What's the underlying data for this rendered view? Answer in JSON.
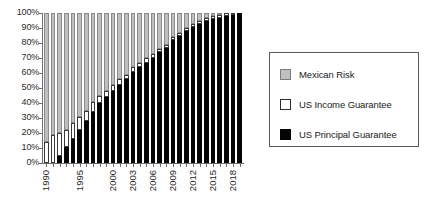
{
  "chart_data": {
    "type": "bar",
    "subtype": "stacked-100-percent",
    "title": "",
    "xlabel": "",
    "ylabel": "",
    "ylim": [
      0,
      100
    ],
    "grid": false,
    "legend_position": "right",
    "categories": [
      "1990",
      "1991",
      "1992",
      "1993",
      "1994",
      "1995",
      "1996",
      "1997",
      "1998",
      "1999",
      "2000",
      "2001",
      "2002",
      "2003",
      "2004",
      "2005",
      "2006",
      "2007",
      "2008",
      "2009",
      "2010",
      "2011",
      "2012",
      "2013",
      "2014",
      "2015",
      "2016",
      "2017",
      "2018",
      "2019"
    ],
    "x_tick_labels": [
      "1990",
      "1995",
      "2000",
      "2003",
      "2006",
      "2009",
      "2012",
      "2015",
      "2018"
    ],
    "y_tick_labels": [
      "0%",
      "10%",
      "20%",
      "30%",
      "40%",
      "50%",
      "60%",
      "70%",
      "80%",
      "90%",
      "100%"
    ],
    "y_tick_values": [
      0,
      10,
      20,
      30,
      40,
      50,
      60,
      70,
      80,
      90,
      100
    ],
    "series": [
      {
        "name": "US Principal Guarantee",
        "color": "#050505",
        "values": [
          0,
          0,
          5,
          11,
          16,
          22,
          28,
          34,
          40,
          44,
          48,
          52,
          56,
          61,
          64,
          67,
          70,
          74,
          77,
          82,
          85,
          88,
          91,
          93,
          95,
          96,
          97,
          98,
          99,
          100
        ]
      },
      {
        "name": "US Income Guarantee",
        "color": "#ffffff",
        "values": [
          14,
          19,
          15,
          11,
          11,
          9,
          7,
          7,
          5,
          4,
          4,
          4,
          3,
          3,
          3,
          3,
          3,
          2,
          2,
          2,
          2,
          2,
          2,
          2,
          2,
          2,
          2,
          2,
          1,
          0
        ]
      },
      {
        "name": "Mexican Risk",
        "color": "#bfbfbf",
        "values": [
          86,
          81,
          80,
          78,
          73,
          69,
          65,
          59,
          55,
          52,
          48,
          44,
          41,
          36,
          33,
          30,
          27,
          24,
          21,
          16,
          13,
          10,
          7,
          5,
          3,
          2,
          1,
          0,
          0,
          0
        ]
      }
    ]
  },
  "legend": {
    "items": [
      {
        "label": "Mexican Risk",
        "swatch": "mexican"
      },
      {
        "label": "US Income Guarantee",
        "swatch": "income"
      },
      {
        "label": "US Principal Guarantee",
        "swatch": "principal"
      }
    ]
  }
}
